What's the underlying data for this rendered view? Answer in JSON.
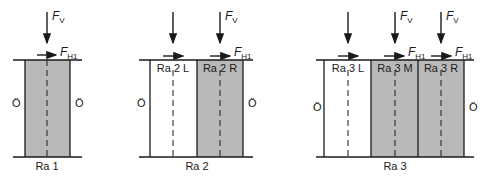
{
  "colors": {
    "fill_shaded": "#b9b9b9",
    "line": "#1a1a1a",
    "background": "#ffffff"
  },
  "labels": {
    "force_vertical": "F",
    "force_vertical_sub": "V",
    "force_horizontal": "F",
    "force_horizontal_sub": "H1",
    "outer_side": "Ö"
  },
  "diagrams": [
    {
      "id": "ra1",
      "caption": "Ra 1",
      "panels": [
        {
          "label": "",
          "shaded": true
        }
      ]
    },
    {
      "id": "ra2",
      "caption": "Ra 2",
      "panels": [
        {
          "label": "Ra 2 L",
          "shaded": false
        },
        {
          "label": "Ra 2 R",
          "shaded": true
        }
      ]
    },
    {
      "id": "ra3",
      "caption": "Ra 3",
      "panels": [
        {
          "label": "Ra 3 L",
          "shaded": false
        },
        {
          "label": "Ra 3 M",
          "shaded": true
        },
        {
          "label": "Ra 3 R",
          "shaded": true
        }
      ]
    }
  ]
}
